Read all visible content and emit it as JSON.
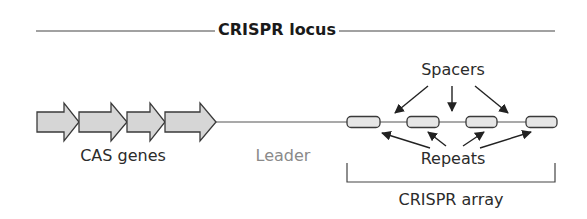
{
  "title": "CRISPR locus",
  "labels": {
    "cas_genes": "CAS genes",
    "leader": "Leader",
    "spacers": "Spacers",
    "repeats": "Repeats",
    "array": "CRISPR array"
  },
  "colors": {
    "stroke": "#3a3a3a",
    "gene_fill": "#d6d6d6",
    "repeat_fill": "#e6e6e6",
    "leader_text": "#8a8a8a"
  },
  "genes": [
    {
      "x0": 37,
      "x1": 79
    },
    {
      "x0": 79,
      "x1": 127
    },
    {
      "x0": 127,
      "x1": 165
    },
    {
      "x0": 165,
      "x1": 216
    }
  ],
  "repeats": [
    {
      "x0": 347,
      "x1": 380
    },
    {
      "x0": 407,
      "x1": 439
    },
    {
      "x0": 466,
      "x1": 497
    },
    {
      "x0": 526,
      "x1": 557
    }
  ]
}
